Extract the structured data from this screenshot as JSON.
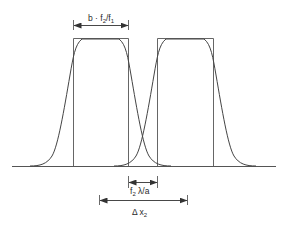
{
  "diagram": {
    "colors": {
      "line": "#555555",
      "curve": "#444444",
      "text": "#2a2a2a",
      "background": "#ffffff"
    },
    "labels": {
      "top_width": {
        "base": "b · f",
        "sub1": "2",
        "mid": "/f",
        "sub2": "1"
      },
      "gap": {
        "base": "f",
        "sub": "2",
        "rest": " λ/a"
      },
      "shift": {
        "base": "Δ x",
        "sub": "2"
      }
    },
    "elements": [
      {
        "type": "rect-profile",
        "name": "left-rectangle",
        "x_start": 73,
        "x_end": 128,
        "top": 38,
        "baseline": 166
      },
      {
        "type": "rect-profile",
        "name": "right-rectangle",
        "x_start": 157,
        "x_end": 213,
        "top": 38,
        "baseline": 166
      },
      {
        "type": "smoothed-profile",
        "name": "left-gaussian-edge-curve"
      },
      {
        "type": "smoothed-profile",
        "name": "right-gaussian-edge-curve"
      }
    ]
  }
}
